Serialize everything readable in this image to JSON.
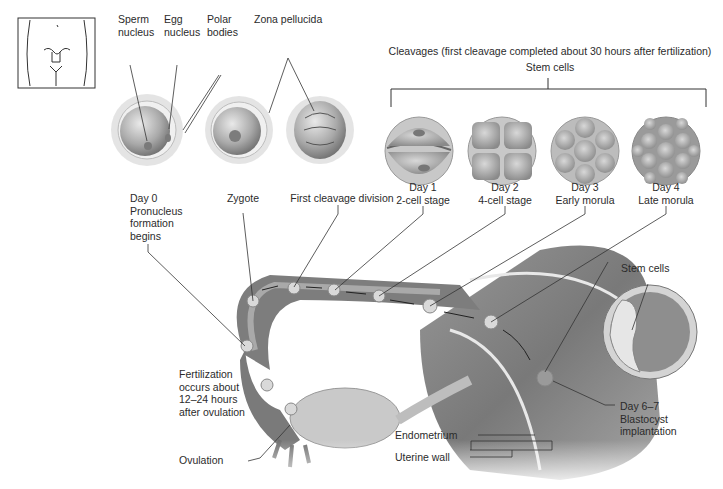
{
  "diagram": {
    "title": "Cleavages (first cleavage completed about 30 hours after fertilization)",
    "bracket_label": "Stem cells",
    "top_labels": {
      "sperm_nucleus": "Sperm\nnucleus",
      "egg_nucleus": "Egg\nnucleus",
      "polar_bodies": "Polar\nbodies",
      "zona_pellucida": "Zona pellucida"
    },
    "stages": [
      {
        "id": "day0",
        "label": "Day 0\nPronucleus\nformation\nbegins"
      },
      {
        "id": "zygote",
        "label": "Zygote"
      },
      {
        "id": "first-cleavage",
        "label": "First cleavage division"
      },
      {
        "id": "day1",
        "label": "Day 1\n2-cell stage"
      },
      {
        "id": "day2",
        "label": "Day 2\n4-cell stage"
      },
      {
        "id": "day3",
        "label": "Day 3\nEarly morula"
      },
      {
        "id": "day4",
        "label": "Day 4\nLate morula"
      }
    ],
    "anatomy_labels": {
      "fertilization": "Fertilization\noccurs about\n12–24 hours\nafter ovulation",
      "ovulation": "Ovulation",
      "endometrium": "Endometrium",
      "uterine_wall": "Uterine wall",
      "implantation": "Day 6–7\nBlastocyst\nimplantation",
      "blastocyst_stem_cells": "Stem cells"
    },
    "colors": {
      "tissue_dark": "#6e6e6e",
      "tissue_mid": "#9a9a9a",
      "tissue_light": "#d4d4d4",
      "line": "#2a2a2a"
    }
  }
}
